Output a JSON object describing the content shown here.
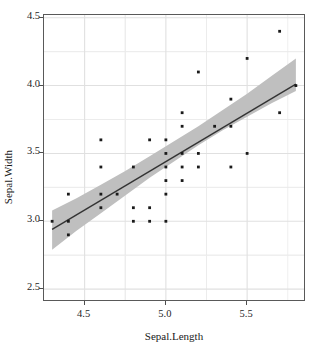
{
  "chart_data": {
    "type": "scatter",
    "title": "",
    "xlabel": "Sepal.Length",
    "ylabel": "Sepal.Width",
    "xlim": [
      4.25,
      5.85
    ],
    "ylim": [
      2.42,
      4.52
    ],
    "xticks": [
      4.5,
      5.0,
      5.5
    ],
    "xticklabels": [
      "4.5",
      "5.0",
      "5.5"
    ],
    "yticks": [
      2.5,
      3.0,
      3.5,
      4.0,
      4.5
    ],
    "yticklabels": [
      "2.5",
      "3.0",
      "3.5",
      "4.0",
      "4.5"
    ],
    "grid": true,
    "grid_minor": true,
    "legend": "none",
    "point_color": "#1a1a1a",
    "line_color": "#333333",
    "ribbon_color": "#bfbfbf",
    "panel_background": "#ffffff",
    "grid_color": "#ebebeb",
    "points": [
      {
        "x": 4.3,
        "y": 3.0
      },
      {
        "x": 4.4,
        "y": 3.2
      },
      {
        "x": 4.4,
        "y": 3.0
      },
      {
        "x": 4.4,
        "y": 2.9
      },
      {
        "x": 4.6,
        "y": 3.6
      },
      {
        "x": 4.6,
        "y": 3.4
      },
      {
        "x": 4.6,
        "y": 3.2
      },
      {
        "x": 4.6,
        "y": 3.1
      },
      {
        "x": 4.7,
        "y": 3.2
      },
      {
        "x": 4.8,
        "y": 3.4
      },
      {
        "x": 4.8,
        "y": 3.1
      },
      {
        "x": 4.8,
        "y": 3.0
      },
      {
        "x": 4.9,
        "y": 3.6
      },
      {
        "x": 4.9,
        "y": 3.1
      },
      {
        "x": 4.9,
        "y": 3.0
      },
      {
        "x": 5.0,
        "y": 3.6
      },
      {
        "x": 5.0,
        "y": 3.5
      },
      {
        "x": 5.0,
        "y": 3.4
      },
      {
        "x": 5.0,
        "y": 3.3
      },
      {
        "x": 5.0,
        "y": 3.2
      },
      {
        "x": 5.0,
        "y": 3.0
      },
      {
        "x": 5.1,
        "y": 3.8
      },
      {
        "x": 5.1,
        "y": 3.7
      },
      {
        "x": 5.1,
        "y": 3.5
      },
      {
        "x": 5.1,
        "y": 3.4
      },
      {
        "x": 5.1,
        "y": 3.3
      },
      {
        "x": 5.2,
        "y": 4.1
      },
      {
        "x": 5.2,
        "y": 3.5
      },
      {
        "x": 5.2,
        "y": 3.4
      },
      {
        "x": 5.3,
        "y": 3.7
      },
      {
        "x": 5.4,
        "y": 3.9
      },
      {
        "x": 5.4,
        "y": 3.7
      },
      {
        "x": 5.4,
        "y": 3.4
      },
      {
        "x": 5.5,
        "y": 4.2
      },
      {
        "x": 5.5,
        "y": 3.5
      },
      {
        "x": 5.7,
        "y": 4.4
      },
      {
        "x": 5.7,
        "y": 3.8
      },
      {
        "x": 5.8,
        "y": 4.0
      }
    ],
    "fit_line": {
      "x_start": 4.3,
      "y_start": 2.94,
      "x_end": 5.8,
      "y_end": 4.01
    },
    "confidence_band": {
      "x": [
        4.3,
        4.45,
        4.6,
        4.75,
        4.9,
        5.05,
        5.2,
        5.35,
        5.5,
        5.65,
        5.8
      ],
      "upper": [
        3.08,
        3.17,
        3.27,
        3.37,
        3.48,
        3.59,
        3.7,
        3.82,
        3.94,
        4.07,
        4.2
      ],
      "lower": [
        2.79,
        2.93,
        3.06,
        3.19,
        3.32,
        3.44,
        3.56,
        3.67,
        3.77,
        3.87,
        3.96
      ]
    }
  }
}
